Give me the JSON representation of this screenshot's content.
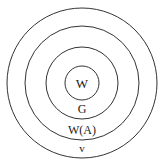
{
  "diagram": {
    "type": "concentric-circles",
    "stroke_color": "#333333",
    "background": "#ffffff",
    "labels": {
      "innermost": "W",
      "second": "G",
      "third": "W(A)",
      "outermost": "v"
    }
  }
}
